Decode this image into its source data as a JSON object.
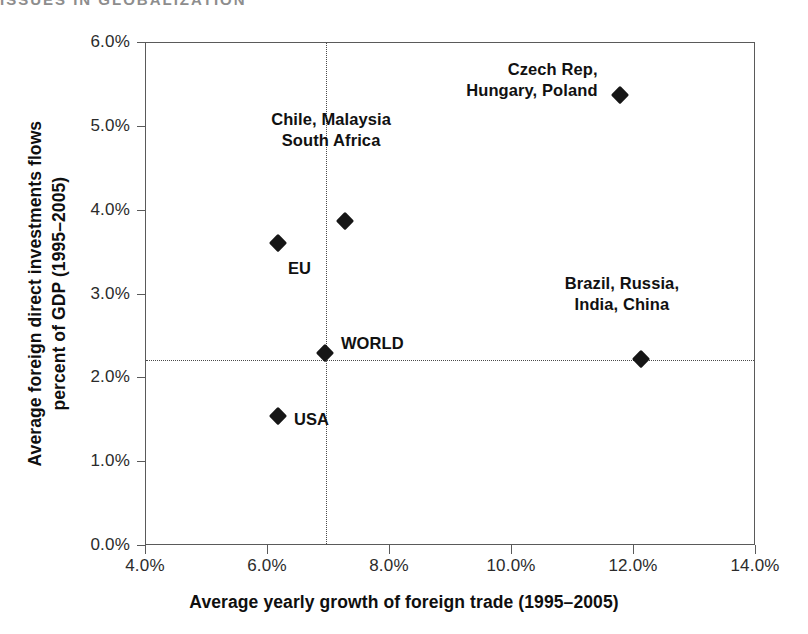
{
  "running_header": "ISSUES IN GLOBALIZATION",
  "chart_data": {
    "type": "scatter",
    "title": "",
    "xlabel": "Average yearly growth of foreign trade (1995–2005)",
    "ylabel_line1": "Average foreign direct investments flows",
    "ylabel_line2": "percent of GDP  (1995–2005)",
    "xlim": [
      4.0,
      14.0
    ],
    "ylim": [
      0.0,
      6.0
    ],
    "grid": false,
    "legend": "none",
    "marker_shape": "diamond",
    "marker_color": "#161616",
    "axis_color": "#5a5a5a",
    "xticks": [
      "4.0%",
      "6.0%",
      "8.0%",
      "10.0%",
      "12.0%",
      "14.0%"
    ],
    "xtick_values": [
      4.0,
      6.0,
      8.0,
      10.0,
      12.0,
      14.0
    ],
    "yticks": [
      "0.0%",
      "1.0%",
      "2.0%",
      "3.0%",
      "4.0%",
      "5.0%",
      "6.0%"
    ],
    "ytick_values": [
      0.0,
      1.0,
      2.0,
      3.0,
      4.0,
      5.0,
      6.0
    ],
    "reference_lines": {
      "vertical_x": 6.95,
      "horizontal_y": 2.22,
      "style": "dotted"
    },
    "points": [
      {
        "label": "Czech Rep,\nHungary, Poland",
        "x": 11.78,
        "y": 5.37,
        "label_align": "right",
        "label_dx": -22,
        "label_dy": -26
      },
      {
        "label": "Chile, Malaysia\nSouth Africa",
        "x": 7.28,
        "y": 3.87,
        "label_align": "center",
        "label_dx": -14,
        "label_dy": -102
      },
      {
        "label": "EU",
        "x": 6.18,
        "y": 3.6,
        "label_align": "left",
        "label_dx": 10,
        "label_dy": 25
      },
      {
        "label": "WORLD",
        "x": 6.95,
        "y": 2.29,
        "label_align": "left",
        "label_dx": 16,
        "label_dy": -10
      },
      {
        "label": "Brazil, Russia,\nIndia, China",
        "x": 12.13,
        "y": 2.22,
        "label_align": "center",
        "label_dx": -19,
        "label_dy": -76
      },
      {
        "label": "USA",
        "x": 6.18,
        "y": 1.54,
        "label_align": "left",
        "label_dx": 16,
        "label_dy": 3
      }
    ]
  }
}
